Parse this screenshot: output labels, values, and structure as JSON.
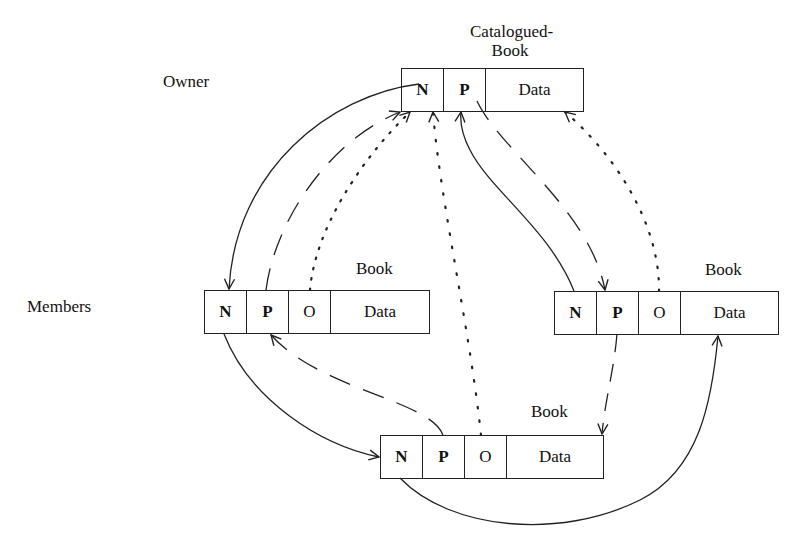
{
  "labels": {
    "owner": "Owner",
    "members": "Members"
  },
  "records": {
    "catalogued_book": {
      "title_line1": "Catalogued-",
      "title_line2": "Book",
      "fields": [
        "N",
        "P",
        "Data"
      ]
    },
    "book_left": {
      "title": "Book",
      "fields": [
        "N",
        "P",
        "O",
        "Data"
      ]
    },
    "book_right": {
      "title": "Book",
      "fields": [
        "N",
        "P",
        "O",
        "Data"
      ]
    },
    "book_bottom": {
      "title": "Book",
      "fields": [
        "N",
        "P",
        "O",
        "Data"
      ]
    }
  },
  "legend_semantics": {
    "solid": "N (next) pointer",
    "dashed": "P (prior) pointer",
    "dotted": "O (owner) pointer"
  },
  "colors": {
    "line": "#222222",
    "background": "#ffffff"
  }
}
